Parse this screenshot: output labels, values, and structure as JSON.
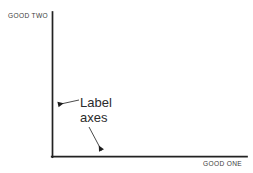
{
  "diagram": {
    "type": "axes-sketch",
    "background_color": "#ffffff",
    "line_color": "#222222",
    "text_color": "#3a3a3a",
    "annotation_color": "#2b2b2b",
    "y_axis": {
      "caption": "GOOD TWO",
      "caption_position": "top-left",
      "x": 52,
      "y_top": 12,
      "y_bottom": 157
    },
    "x_axis": {
      "caption": "GOOD ONE",
      "caption_position": "bottom-right",
      "y": 157,
      "x_left": 52,
      "x_right": 247
    },
    "annotation": {
      "line_1": "Label",
      "line_2": "axes",
      "pointers": [
        {
          "name": "pointer-to-y-axis",
          "from_x": 79,
          "from_y": 100,
          "to_x": 54,
          "to_y": 105,
          "target": "y-axis"
        },
        {
          "name": "pointer-to-x-axis",
          "from_x": 89,
          "from_y": 127,
          "to_x": 104,
          "to_y": 155,
          "target": "x-axis"
        }
      ]
    }
  }
}
